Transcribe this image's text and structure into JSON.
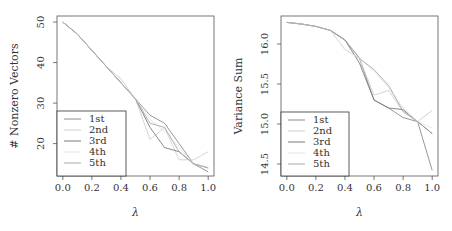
{
  "chart_data": [
    {
      "type": "line",
      "title": "",
      "xlabel": "λ",
      "ylabel": "# Nonzero Vectors",
      "xlim": [
        -0.04,
        1.04
      ],
      "ylim": [
        12,
        51.5
      ],
      "xticks": [
        0.0,
        0.2,
        0.4,
        0.6,
        0.8,
        1.0
      ],
      "xtick_labels": [
        "0.0",
        "0.2",
        "0.4",
        "0.6",
        "0.8",
        "1.0"
      ],
      "yticks": [
        20,
        30,
        40,
        50
      ],
      "ytick_labels": [
        "20",
        "30",
        "40",
        "50"
      ],
      "grid": false,
      "legend_position": "bottom-left",
      "x": [
        0.0,
        0.1,
        0.2,
        0.3,
        0.4,
        0.5,
        0.6,
        0.7,
        0.8,
        0.9,
        1.0
      ],
      "series": [
        {
          "name": "1st",
          "color": "#8c8c8c",
          "values": [
            50,
            47,
            43,
            39,
            35,
            31,
            27,
            25,
            20,
            15,
            13
          ]
        },
        {
          "name": "2nd",
          "color": "#cfcfcf",
          "values": [
            50,
            47,
            43,
            39,
            36,
            31,
            21,
            24,
            16,
            16,
            18
          ]
        },
        {
          "name": "3rd",
          "color": "#7a7a7a",
          "values": [
            50,
            47,
            43,
            39,
            35,
            31,
            24,
            19,
            18,
            15,
            14
          ]
        },
        {
          "name": "4th",
          "color": "#e3e3e3",
          "values": [
            50,
            47,
            43,
            39,
            35,
            31,
            26,
            23,
            19,
            15,
            14
          ]
        },
        {
          "name": "5th",
          "color": "#a9a9a9",
          "values": [
            50,
            47,
            43,
            39,
            35,
            31,
            25,
            24,
            18,
            15,
            14
          ]
        }
      ]
    },
    {
      "type": "line",
      "title": "",
      "xlabel": "λ",
      "ylabel": "Variance Sum",
      "xlim": [
        -0.04,
        1.04
      ],
      "ylim": [
        14.35,
        16.35
      ],
      "xticks": [
        0.0,
        0.2,
        0.4,
        0.6,
        0.8,
        1.0
      ],
      "xtick_labels": [
        "0.0",
        "0.2",
        "0.4",
        "0.6",
        "0.8",
        "1.0"
      ],
      "yticks": [
        14.5,
        15.0,
        15.5,
        16.0
      ],
      "ytick_labels": [
        "14.5",
        "15.0",
        "15.5",
        "16.0"
      ],
      "grid": false,
      "legend_position": "bottom-left",
      "x": [
        0.0,
        0.1,
        0.2,
        0.3,
        0.4,
        0.5,
        0.6,
        0.7,
        0.8,
        0.9,
        1.0
      ],
      "series": [
        {
          "name": "1st",
          "color": "#8c8c8c",
          "values": [
            16.27,
            16.25,
            16.22,
            16.17,
            16.05,
            15.82,
            15.3,
            15.2,
            15.08,
            15.03,
            14.42
          ]
        },
        {
          "name": "2nd",
          "color": "#cfcfcf",
          "values": [
            16.27,
            16.25,
            16.22,
            16.17,
            15.93,
            15.82,
            15.36,
            15.42,
            15.15,
            15.03,
            15.17
          ]
        },
        {
          "name": "3rd",
          "color": "#7a7a7a",
          "values": [
            16.27,
            16.25,
            16.22,
            16.17,
            16.05,
            15.76,
            15.3,
            15.2,
            15.18,
            15.03,
            14.88
          ]
        },
        {
          "name": "4th",
          "color": "#e3e3e3",
          "values": [
            16.27,
            16.25,
            16.22,
            16.17,
            15.93,
            15.82,
            15.66,
            15.46,
            15.2,
            15.03,
            14.95
          ]
        },
        {
          "name": "5th",
          "color": "#a9a9a9",
          "values": [
            16.27,
            16.25,
            16.22,
            16.17,
            16.05,
            15.82,
            15.68,
            15.48,
            15.16,
            15.03,
            14.88
          ]
        }
      ]
    }
  ]
}
